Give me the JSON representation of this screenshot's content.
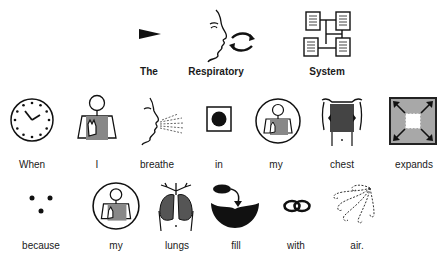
{
  "title_row": [
    {
      "word": "The",
      "icon": "pointer-triangle-icon"
    },
    {
      "word": "Respiratory",
      "icon": "breathing-face-icon"
    },
    {
      "word": "System",
      "icon": "system-network-icon"
    }
  ],
  "sentence_row_1": [
    {
      "word": "When",
      "icon": "clock-icon"
    },
    {
      "word": "I",
      "icon": "self-person-icon"
    },
    {
      "word": "breathe",
      "icon": "breathe-face-icon"
    },
    {
      "word": "in",
      "icon": "in-box-icon"
    },
    {
      "word": "my",
      "icon": "my-person-circle-icon"
    },
    {
      "word": "chest",
      "icon": "chest-torso-icon"
    },
    {
      "word": "expands",
      "icon": "expand-arrows-icon"
    }
  ],
  "sentence_row_2": [
    {
      "word": "because",
      "icon": "because-dots-icon"
    },
    {
      "word": "my",
      "icon": "my-person-circle-icon"
    },
    {
      "word": "lungs",
      "icon": "lungs-icon"
    },
    {
      "word": "fill",
      "icon": "fill-bowl-icon"
    },
    {
      "word": "with",
      "icon": "with-rings-icon"
    },
    {
      "word": "air.",
      "icon": "air-swirl-icon"
    }
  ]
}
